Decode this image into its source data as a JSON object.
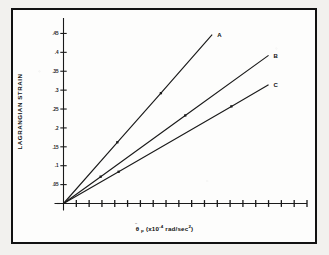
{
  "figure": {
    "background_color": "#f2f1ee",
    "frame_color": "#111111",
    "ink_color": "#1a1a1a"
  },
  "chart_data": {
    "type": "line",
    "title": "",
    "subtitle": "",
    "xlabel": "θ̈p (x10⁻⁴ rad/sec²)",
    "ylabel": "LAGRANGIAN STRAIN",
    "xlim": [
      0,
      19
    ],
    "ylim": [
      0,
      0.475
    ],
    "grid": false,
    "legend_position": "inline-right-end",
    "y_ticks": [
      0.05,
      0.1,
      0.15,
      0.2,
      0.25,
      0.3,
      0.35,
      0.4,
      0.45
    ],
    "y_tick_labels": [
      ".05",
      ".1",
      ".15",
      ".2",
      ".25",
      ".3",
      ".35",
      ".4",
      ".45"
    ],
    "x_ticks": [
      1,
      2,
      3,
      4,
      5,
      6,
      7,
      8,
      9,
      10,
      11,
      12,
      13,
      14,
      15,
      16,
      17,
      18,
      19
    ],
    "x_tick_labels": [
      "",
      "",
      "",
      "",
      "",
      "",
      "",
      "",
      "",
      "",
      "",
      "",
      "",
      "",
      "",
      "",
      "",
      "",
      ""
    ],
    "series": [
      {
        "name": "A",
        "label": "A",
        "slope": 0.0385,
        "x": [
          0,
          4.2,
          7.6,
          11.6
        ],
        "values": [
          0,
          0.162,
          0.292,
          0.447
        ],
        "markers": [
          {
            "x": 4.2,
            "y": 0.162
          },
          {
            "x": 7.6,
            "y": 0.292
          }
        ]
      },
      {
        "name": "B",
        "label": "B",
        "slope": 0.0245,
        "x": [
          0,
          2.9,
          9.5,
          16.0
        ],
        "values": [
          0,
          0.071,
          0.233,
          0.392
        ],
        "markers": [
          {
            "x": 2.9,
            "y": 0.071
          },
          {
            "x": 9.5,
            "y": 0.233
          }
        ]
      },
      {
        "name": "C",
        "label": "C",
        "slope": 0.0196,
        "x": [
          0,
          4.3,
          13.1,
          16.0
        ],
        "values": [
          0,
          0.084,
          0.257,
          0.314
        ],
        "markers": [
          {
            "x": 4.3,
            "y": 0.084
          },
          {
            "x": 13.1,
            "y": 0.257
          }
        ]
      }
    ]
  },
  "axis_titles": {
    "y": "LAGRANGIAN STRAIN",
    "x_symbol": "θ",
    "x_sub": "p",
    "x_rest_a": " (x10",
    "x_sup_a": "-4",
    "x_rest_b": " rad/sec",
    "x_sup_b": "2",
    "x_rest_c": ")"
  }
}
